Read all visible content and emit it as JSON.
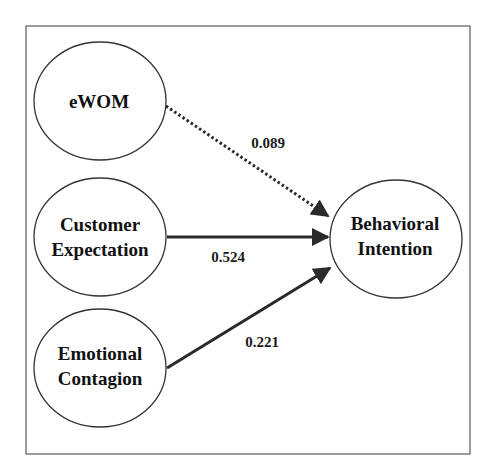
{
  "diagram": {
    "type": "structural-path-model",
    "colors": {
      "line": "#2a2a2a",
      "frame": "#7a7a7a",
      "ellipse_stroke": "#333333",
      "background": "#ffffff"
    },
    "nodes": [
      {
        "id": "ewom",
        "lines": [
          "eWOM"
        ]
      },
      {
        "id": "customer-expectation",
        "lines": [
          "Customer",
          "Expectation"
        ]
      },
      {
        "id": "emotional-contagion",
        "lines": [
          "Emotional",
          "Contagion"
        ]
      },
      {
        "id": "behavioral-intention",
        "lines": [
          "Behavioral",
          "Intention"
        ]
      }
    ],
    "paths": [
      {
        "from": "eWOM",
        "to": "Behavioral Intention",
        "coefficient": "0.089",
        "style": "dotted"
      },
      {
        "from": "Customer Expectation",
        "to": "Behavioral Intention",
        "coefficient": "0.524",
        "style": "solid"
      },
      {
        "from": "Emotional Contagion",
        "to": "Behavioral Intention",
        "coefficient": "0.221",
        "style": "solid"
      }
    ]
  }
}
